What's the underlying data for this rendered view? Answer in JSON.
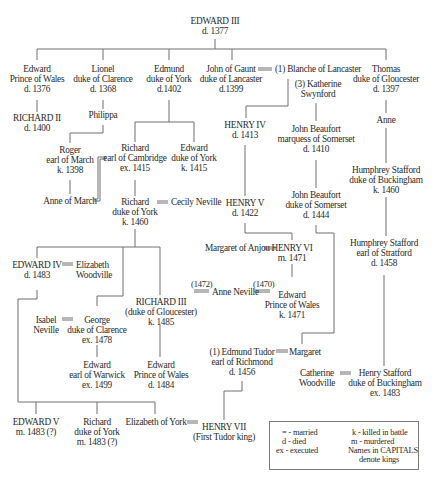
{
  "people": {
    "edward3": {
      "lines": [
        "EDWARD III",
        "d. 1377"
      ]
    },
    "edward_pw": {
      "lines": [
        "Edward",
        "Prince of Wales",
        "d. 1376"
      ]
    },
    "lionel": {
      "lines": [
        "Lionel",
        "duke of Clarence",
        "d. 1368"
      ]
    },
    "edmund": {
      "lines": [
        "Edmund",
        "duke of York",
        "d.1402"
      ]
    },
    "john_gaunt": {
      "lines": [
        "John  of Gaunt",
        "duke of Lancaster",
        "d.1399"
      ]
    },
    "blanche": {
      "lines": [
        "(1) Blanche of Lancaster"
      ]
    },
    "katherine": {
      "lines": [
        "(3) Katherine",
        "Swynford"
      ]
    },
    "thomas": {
      "lines": [
        "Thomas",
        "duke of Gloucester",
        "d. 1397"
      ]
    },
    "richard2": {
      "lines": [
        "RICHARD II",
        "d. 1400"
      ]
    },
    "philippa": {
      "lines": [
        "Philippa"
      ]
    },
    "roger": {
      "lines": [
        "Roger",
        "earl of March",
        "k. 1398"
      ]
    },
    "anne_march": {
      "lines": [
        "Anne of March"
      ]
    },
    "richard_cambridge": {
      "lines": [
        "Richard",
        "earl of Cambridge",
        "ex. 1415"
      ]
    },
    "edward_york": {
      "lines": [
        "Edward",
        "duke of York",
        "k. 1415"
      ]
    },
    "richard_york": {
      "lines": [
        "Richard",
        "duke of York",
        "k. 1460"
      ]
    },
    "cecily": {
      "lines": [
        "Cecily Neville"
      ]
    },
    "henry4": {
      "lines": [
        "HENRY IV",
        "d. 1413"
      ]
    },
    "henry5": {
      "lines": [
        "HENRY V",
        "d. 1422"
      ]
    },
    "john_beaufort_m": {
      "lines": [
        "John Beaufort",
        "marquess of Somerset",
        "d. 1410"
      ]
    },
    "john_beaufort_d": {
      "lines": [
        "John Beaufort",
        "duke of Somerset",
        "d. 1444"
      ]
    },
    "anne_g": {
      "lines": [
        "Anne"
      ]
    },
    "humphrey_buck": {
      "lines": [
        "Humphrey Stafford",
        "duke of Buckingham",
        "k. 1460"
      ]
    },
    "humphrey_strat": {
      "lines": [
        "Humphrey Stafford",
        "earl of Stratford",
        "d. 1458"
      ]
    },
    "margaret_anjou": {
      "lines": [
        "Margaret of Anjou"
      ]
    },
    "henry6": {
      "lines": [
        "HENRY VI",
        "m. 1471"
      ]
    },
    "edward4": {
      "lines": [
        "EDWARD IV",
        "d. 1483"
      ]
    },
    "elizabeth_w": {
      "lines": [
        "Elizabeth",
        "Woodville"
      ]
    },
    "richard3": {
      "lines": [
        "RICHARD III",
        "(duke of Gloucester)",
        "k. 1485"
      ]
    },
    "anne_neville": {
      "lines": [
        "Anne Neville"
      ]
    },
    "edward_pw2": {
      "lines": [
        "Edward",
        "Prince of Wales",
        "k. 1471"
      ]
    },
    "isabel": {
      "lines": [
        "Isabel",
        "Neville"
      ]
    },
    "george": {
      "lines": [
        "George",
        "duke of Clarence",
        "ex. 1478"
      ]
    },
    "edward_warwick": {
      "lines": [
        "Edward",
        "earl of Warwick",
        "ex. 1499"
      ]
    },
    "edward_pw3": {
      "lines": [
        "Edward",
        "Prince of Wales",
        "d. 1484"
      ]
    },
    "edmund_tudor": {
      "lines": [
        "(1) Edmund Tudor",
        "earl of Richmond",
        "d. 1456"
      ]
    },
    "margaret_b": {
      "lines": [
        "Margaret"
      ]
    },
    "catherine_w": {
      "lines": [
        "Catherine",
        "Woodville"
      ]
    },
    "henry_stafford": {
      "lines": [
        "Henry Stafford",
        "duke of Buckingham",
        "ex. 1483"
      ]
    },
    "edward5": {
      "lines": [
        "EDWARD V",
        "m. 1483 (?)"
      ]
    },
    "richard_york2": {
      "lines": [
        "Richard",
        "duke of York",
        "m. 1483 (?)"
      ]
    },
    "elizabeth_york": {
      "lines": [
        "Elizabeth of York"
      ]
    },
    "henry7": {
      "lines": [
        "HENRY VII",
        "(First Tudor king)"
      ]
    }
  },
  "marriage_years": {
    "richard3_anne": "(1472)",
    "anne_edward": "(1470)"
  },
  "legend": {
    "married": "= -  married",
    "died": "d -  died",
    "executed": "ex -  executed",
    "killed": "k -  killed in battle",
    "murdered": "m -  murdered",
    "capitals": "Names in CAPITALS",
    "kings": "denote  kings"
  },
  "colors": {
    "line": "#6e6e6e",
    "text": "#2a2a2a",
    "background": "#ffffff"
  }
}
